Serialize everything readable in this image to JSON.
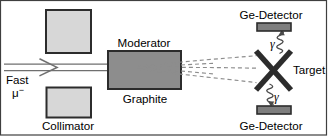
{
  "figure": {
    "name": "muon-beam-moderator-target-detector-setup",
    "beam": {
      "label": "Fast",
      "particle_symbol": "μ",
      "particle_charge": "−"
    },
    "collimator": {
      "label": "Collimator"
    },
    "moderator": {
      "top_label": "Moderator",
      "bottom_label": "Graphite"
    },
    "target": {
      "label": "Target"
    },
    "detectors": {
      "top": {
        "label": "Ge-Detector",
        "gamma_label": "γ"
      },
      "bottom": {
        "label": "Ge-Detector",
        "gamma_label": "γ"
      }
    },
    "colors": {
      "collimator_fill": "#d7d7d7",
      "moderator_fill": "#8d8d8d",
      "detector_fill": "#7e7e7e",
      "outline": "#2c2c2c",
      "beam_line": "#6f6f6f",
      "dashed_line": "#8d8d8d",
      "target_stroke": "#2c2c2c",
      "frame": "#3f3f3f",
      "text": "#000000"
    }
  }
}
